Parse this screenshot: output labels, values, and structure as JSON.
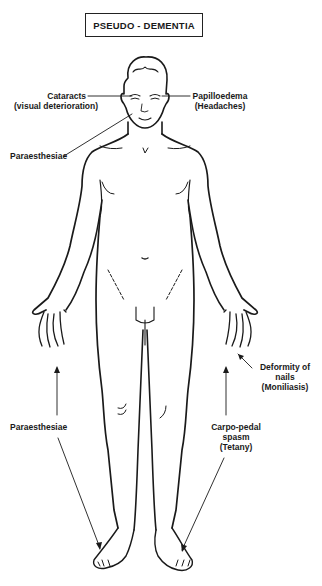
{
  "title": "PSEUDO - DEMENTIA",
  "labels": {
    "cataracts": {
      "line1": "Cataracts",
      "line2": "(visual deterioration)"
    },
    "papilloedema": {
      "line1": "Papilloedema",
      "line2": "(Headaches)"
    },
    "paraesthesiae_face": {
      "line1": "Paraesthesiae"
    },
    "deformity_nails": {
      "line1": "Deformity of",
      "line2": "nails",
      "line3": "(Moniliasis)"
    },
    "paraesthesiae_limbs": {
      "line1": "Paraesthesiae"
    },
    "carpo_pedal": {
      "line1": "Carpo-pedal",
      "line2": "spasm",
      "line3": "(Tetany)"
    }
  },
  "colors": {
    "ink": "#1a1a1a",
    "background": "#ffffff"
  }
}
